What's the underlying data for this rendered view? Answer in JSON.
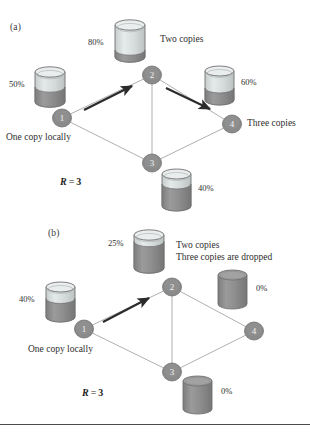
{
  "figure": {
    "background": "#ffffff",
    "node_fill": "#8a8a8a",
    "node_stroke": "#6d6d6d",
    "edge_color": "#9a9a9a",
    "arrow_color": "#2b2b2b",
    "cyl_dark": "#8d8d8d",
    "cyl_light": "#d8dcdc",
    "text_color": "#2e2e2e"
  },
  "panels": [
    {
      "id": "a",
      "label": "(a)",
      "replication": {
        "symbol": "R",
        "equals": "=",
        "value": "3"
      },
      "nodes": [
        {
          "id": "n1",
          "label": "1",
          "cx": 62,
          "cy": 118
        },
        {
          "id": "n2",
          "label": "2",
          "cx": 152,
          "cy": 75
        },
        {
          "id": "n3",
          "label": "3",
          "cx": 152,
          "cy": 163
        },
        {
          "id": "n4",
          "label": "4",
          "cx": 232,
          "cy": 124
        }
      ],
      "edges": [
        {
          "from": "n1",
          "to": "n2"
        },
        {
          "from": "n2",
          "to": "n4"
        },
        {
          "from": "n1",
          "to": "n3"
        },
        {
          "from": "n3",
          "to": "n4"
        },
        {
          "from": "n2",
          "to": "n3"
        }
      ],
      "arrows": [
        {
          "name": "arrow-1-to-2",
          "x1": 84,
          "y1": 110,
          "x2": 134,
          "y2": 85
        },
        {
          "name": "arrow-2-to-4",
          "x1": 166,
          "y1": 88,
          "x2": 212,
          "y2": 110
        }
      ],
      "disks": [
        {
          "name": "disk-node-1",
          "percent": "50%",
          "fill_ratio": 0.5,
          "x": 33,
          "y": 66,
          "w": 34,
          "h": 42,
          "pct_x": 10,
          "pct_y": 80,
          "pct_align": "right"
        },
        {
          "name": "disk-node-2",
          "percent": "80%",
          "fill_ratio": 0.22,
          "x": 113,
          "y": 19,
          "w": 34,
          "h": 44,
          "pct_x": 86,
          "pct_y": 38,
          "pct_align": "right"
        },
        {
          "name": "disk-node-4",
          "percent": "60%",
          "fill_ratio": 0.4,
          "x": 203,
          "y": 65,
          "w": 33,
          "h": 41,
          "pct_x": 241,
          "pct_y": 78,
          "pct_align": "left"
        },
        {
          "name": "disk-node-3",
          "percent": "40%",
          "fill_ratio": 0.7,
          "x": 160,
          "y": 168,
          "w": 33,
          "h": 44,
          "pct_x": 198,
          "pct_y": 184,
          "pct_align": "left"
        }
      ],
      "annotations": [
        {
          "name": "label-two-copies",
          "text": "Two copies",
          "x": 160,
          "y": 36
        },
        {
          "name": "label-three-copies",
          "text": "Three copies",
          "x": 247,
          "y": 120
        },
        {
          "name": "label-one-copy-locally",
          "text": "One copy locally",
          "x": 8,
          "y": 133
        }
      ],
      "r_pos": {
        "x": 60,
        "y": 177
      }
    },
    {
      "id": "b",
      "label": "(b)",
      "replication": {
        "symbol": "R",
        "equals": "=",
        "value": "3"
      },
      "nodes": [
        {
          "id": "n1",
          "label": "1",
          "cx": 84,
          "cy": 329
        },
        {
          "id": "n2",
          "label": "2",
          "cx": 172,
          "cy": 287
        },
        {
          "id": "n3",
          "label": "3",
          "cx": 172,
          "cy": 372
        },
        {
          "id": "n4",
          "label": "4",
          "cx": 254,
          "cy": 331
        }
      ],
      "edges": [
        {
          "from": "n1",
          "to": "n2"
        },
        {
          "from": "n2",
          "to": "n4"
        },
        {
          "from": "n1",
          "to": "n3"
        },
        {
          "from": "n3",
          "to": "n4"
        },
        {
          "from": "n2",
          "to": "n3"
        }
      ],
      "arrows": [
        {
          "name": "arrow-1-to-2",
          "x1": 103,
          "y1": 322,
          "x2": 151,
          "y2": 297
        }
      ],
      "disks": [
        {
          "name": "disk-node-1",
          "percent": "40%",
          "fill_ratio": 0.62,
          "x": 44,
          "y": 281,
          "w": 33,
          "h": 42,
          "pct_x": 40,
          "pct_y": 296,
          "pct_align": "right"
        },
        {
          "name": "disk-node-2",
          "percent": "25%",
          "fill_ratio": 0.8,
          "x": 132,
          "y": 229,
          "w": 34,
          "h": 45,
          "pct_x": 129,
          "pct_y": 240,
          "pct_align": "right"
        },
        {
          "name": "disk-node-4",
          "percent": "0%",
          "fill_ratio": 1.0,
          "x": 216,
          "y": 269,
          "w": 33,
          "h": 41,
          "pct_x": 256,
          "pct_y": 285,
          "pct_align": "left"
        },
        {
          "name": "disk-node-3",
          "percent": "0%",
          "fill_ratio": 1.0,
          "x": 181,
          "y": 375,
          "w": 33,
          "h": 40,
          "pct_x": 221,
          "pct_y": 388,
          "pct_align": "left"
        }
      ],
      "annotations": [
        {
          "name": "label-two-copies",
          "text": "Two copies",
          "x": 178,
          "y": 242
        },
        {
          "name": "label-three-copies-dropped",
          "text": "Three copies are dropped",
          "x": 178,
          "y": 254
        },
        {
          "name": "label-one-copy-locally",
          "text": "One copy locally",
          "x": 30,
          "y": 345
        }
      ],
      "r_pos": {
        "x": 82,
        "y": 388
      }
    }
  ],
  "divider": {
    "name": "bottom-rule",
    "y": 424
  }
}
